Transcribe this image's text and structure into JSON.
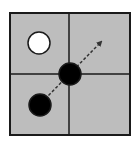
{
  "diagram": {
    "colors": {
      "background": "#ffffff",
      "grid_fill": "#bdbdbd",
      "grid_stroke": "#1a1a1a",
      "white_circle_fill": "#ffffff",
      "black_circle_fill": "#000000",
      "arrow_color": "#333333"
    },
    "grid": {
      "rows": 2,
      "cols": 2,
      "x": 10,
      "y": 13,
      "width": 120,
      "height": 122,
      "divider_x": 69,
      "divider_y": 74
    },
    "circles": [
      {
        "name": "white-circle",
        "cx": 39,
        "cy": 43,
        "r": 11,
        "fill": "white"
      },
      {
        "name": "center-black-circle",
        "cx": 70,
        "cy": 74,
        "r": 11,
        "fill": "black"
      },
      {
        "name": "lower-left-black-circle",
        "cx": 40,
        "cy": 105,
        "r": 11,
        "fill": "black"
      }
    ],
    "arrow": {
      "style": "dashed",
      "from": [
        45,
        99
      ],
      "to": [
        101,
        42
      ]
    }
  }
}
